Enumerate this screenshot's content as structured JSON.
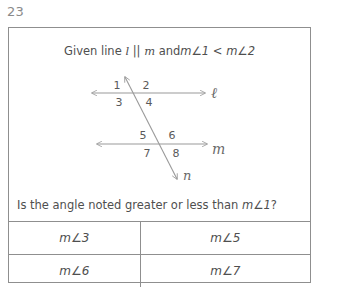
{
  "question_number": "23",
  "prompt": {
    "given_text": "Given line l || m and m∠1 < m∠2",
    "given_prefix": "Given line ",
    "given_line_l": "l",
    "given_parallel": " || ",
    "given_line_m": "m",
    "given_and": " and",
    "given_m1": "m∠1",
    "given_less": " < ",
    "given_m2": "m∠2"
  },
  "figure": {
    "line_l_label": "ℓ",
    "line_m_label": "m",
    "transversal_label": "n",
    "angle_labels": {
      "a1": "1",
      "a2": "2",
      "a3": "3",
      "a4": "4",
      "a5": "5",
      "a6": "6",
      "a7": "7",
      "a8": "8"
    },
    "stroke_color": "#9a9a9a"
  },
  "question": {
    "text": "Is the angle noted greater or less than m∠1?",
    "text_prefix": "Is the angle noted greater or less than ",
    "text_angle": "m∠1",
    "text_suffix": "?"
  },
  "answer_table": {
    "rows": [
      {
        "left": "m∠3",
        "right": "m∠5"
      },
      {
        "left": "m∠6",
        "right": "m∠7"
      }
    ]
  },
  "colors": {
    "border": "#8f8f8f",
    "text": "#4f4f4f",
    "muted": "#8a8a8a",
    "background": "#ffffff"
  }
}
